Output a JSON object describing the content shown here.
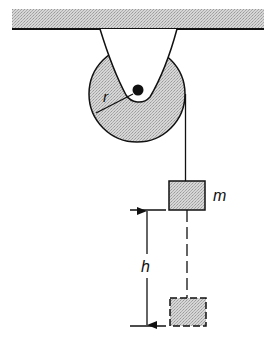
{
  "diagram": {
    "type": "pulley-system",
    "labels": {
      "radius": "r",
      "mass": "m",
      "height": "h"
    },
    "components": {
      "ceiling": {
        "x": 12,
        "y": 9,
        "width": 252,
        "height": 20
      },
      "bracket": {
        "top_left_x": 100,
        "top_right_x": 177,
        "top_y": 29,
        "bottom_y": 103
      },
      "pulley": {
        "cx": 137,
        "cy": 94,
        "radius": 48
      },
      "axle": {
        "cx": 138,
        "cy": 90,
        "radius": 5
      },
      "rope": {
        "x": 186,
        "y_top": 94,
        "y_bottom": 181
      },
      "mass_block": {
        "x": 169,
        "y": 181,
        "width": 36,
        "height": 29
      },
      "dashed_rope": {
        "x": 187,
        "y_top": 210,
        "y_bottom": 298
      },
      "final_block": {
        "x": 170,
        "y": 298,
        "width": 36,
        "height": 28
      },
      "height_marker": {
        "x": 147,
        "y_top": 210,
        "y_bottom": 326,
        "tick_left": 130,
        "tick_right": 166
      }
    },
    "colors": {
      "fill": "#c8c8c8",
      "stroke": "#111111",
      "background": "#ffffff"
    }
  }
}
